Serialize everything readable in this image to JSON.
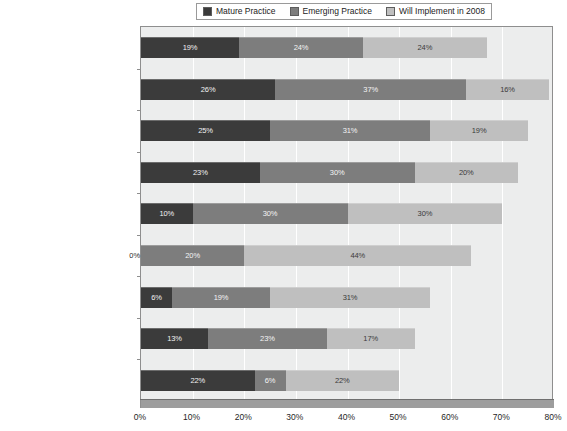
{
  "legend": {
    "position": "top-center",
    "entries": [
      {
        "label": "Mature Practice",
        "color": "#3b3b3b",
        "key": "mature"
      },
      {
        "label": "Emerging Practice",
        "color": "#7d7d7d",
        "key": "emerging"
      },
      {
        "label": "Will Implement in 2008",
        "color": "#bfbfbf",
        "key": "will_implement"
      }
    ]
  },
  "chart_data": {
    "type": "bar",
    "orientation": "horizontal",
    "stacked": true,
    "title": "",
    "subtitle": "",
    "xlabel": "",
    "ylabel": "",
    "xlim": [
      0,
      80
    ],
    "xtick_labels": [
      "0%",
      "10%",
      "20%",
      "30%",
      "40%",
      "50%",
      "60%",
      "70%",
      "80%"
    ],
    "xticks": [
      0,
      10,
      20,
      30,
      40,
      50,
      60,
      70,
      80
    ],
    "grid": "vertical",
    "value_format": "percent",
    "categories": [
      "Survey Average",
      "Insurance",
      "Telecom & Online Service",
      "Banking & Financial Service",
      "Utilities & Energy",
      "Defense/Military",
      "Manufacturing",
      "Federal Government (civilian, nondefense)",
      "State & Municipal Government"
    ],
    "series": [
      {
        "name": "Mature Practice",
        "color": "#3b3b3b",
        "values": [
          19,
          26,
          25,
          23,
          10,
          0,
          6,
          13,
          22
        ],
        "labels": [
          "19%",
          "26%",
          "25%",
          "23%",
          "10%",
          "0%",
          "6%",
          "13%",
          "22%"
        ]
      },
      {
        "name": "Emerging Practice",
        "color": "#7d7d7d",
        "values": [
          24,
          37,
          31,
          30,
          30,
          20,
          19,
          23,
          6
        ],
        "labels": [
          "24%",
          "37%",
          "31%",
          "30%",
          "30%",
          "20%",
          "19%",
          "23%",
          "6%"
        ]
      },
      {
        "name": "Will Implement in 2008",
        "color": "#bfbfbf",
        "values": [
          24,
          16,
          19,
          20,
          30,
          44,
          31,
          17,
          22
        ],
        "labels": [
          "24%",
          "16%",
          "19%",
          "20%",
          "30%",
          "44%",
          "31%",
          "17%",
          "22%"
        ]
      }
    ],
    "totals": [
      67,
      79,
      75,
      73,
      70,
      64,
      56,
      53,
      50
    ]
  },
  "colors": {
    "plot_background": "#eceded",
    "gridline": "#ffffff",
    "axis": "#8e8e8e",
    "shadow": "#9d9d9d"
  }
}
